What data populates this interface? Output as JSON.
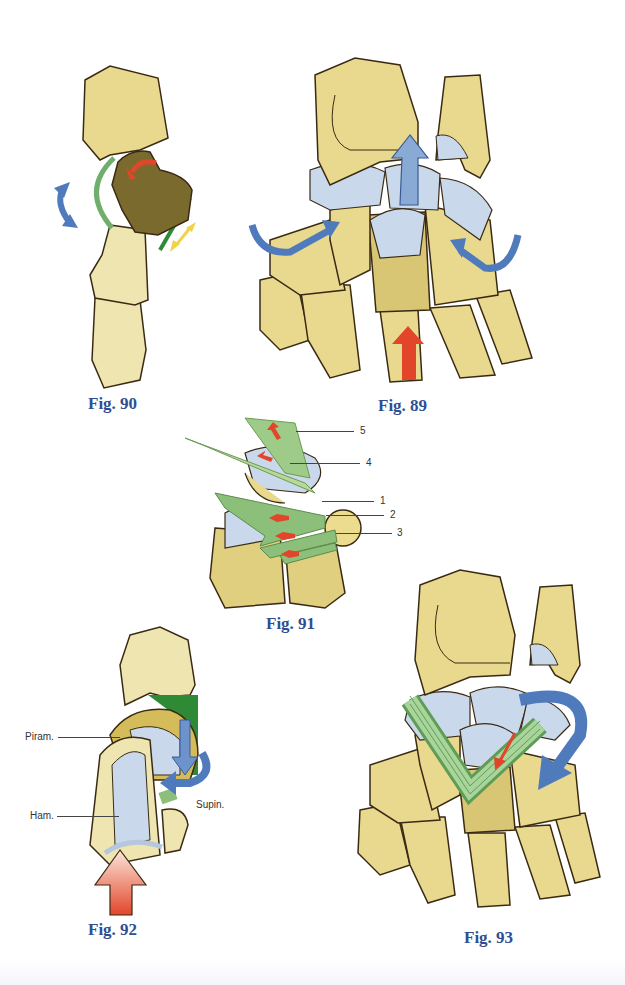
{
  "page": {
    "background": "#ffffff",
    "caption_color": "#2e4e93"
  },
  "colors": {
    "bone": "#e8d98e",
    "bone_light": "#efe5b0",
    "bone_dark": "#7a6a2e",
    "cartilage": "#c9d8ea",
    "ligament_green": "#8fc58a",
    "ligament_dark_green": "#2f8a36",
    "arrow_blue": "#4f7bbd",
    "arrow_red": "#e2462a",
    "arrow_yellow": "#f0d34a",
    "outline": "#3a2a14"
  },
  "figures": [
    {
      "id": "fig90",
      "caption": "Fig. 90",
      "description": "Lateral view of bone chain with dark talus rotating; blue curved double arrow, red rotation arrow, yellow double arrow"
    },
    {
      "id": "fig89",
      "caption": "Fig. 89",
      "description": "Dorsal view of tarsus and metatarsals; blue curved arrows, blue upward arrow, red upward arrow"
    },
    {
      "id": "fig91",
      "caption": "Fig. 91",
      "description": "Ligament bundles with red arrows",
      "labels": [
        "1",
        "2",
        "3",
        "4",
        "5"
      ]
    },
    {
      "id": "fig92",
      "caption": "Fig. 92",
      "description": "Medial column with supination rotation",
      "labels": {
        "piram": "Piram.",
        "ham": "Ham.",
        "supin": "Supin."
      }
    },
    {
      "id": "fig93",
      "caption": "Fig. 93",
      "description": "Dorsal view with V-shaped ligament and large blue curved arrow, small red arrow"
    }
  ]
}
